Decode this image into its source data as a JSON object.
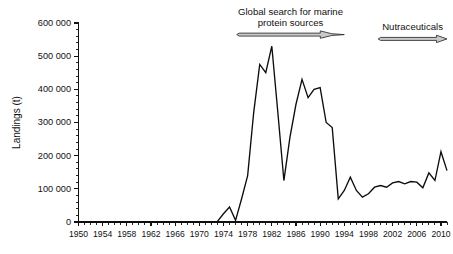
{
  "chart_data": {
    "type": "line",
    "title": "",
    "xlabel": "",
    "ylabel": "Landings (t)",
    "xlim": [
      1950,
      2011
    ],
    "ylim": [
      0,
      600000
    ],
    "grid": false,
    "legend": null,
    "y_ticks": [
      0,
      100000,
      200000,
      300000,
      400000,
      500000,
      600000
    ],
    "y_tick_labels": [
      "0",
      "100 000",
      "200 000",
      "300 000",
      "400 000",
      "500 000",
      "600 000"
    ],
    "y_minor_tick_interval": 20000,
    "x_ticks": [
      1950,
      1954,
      1958,
      1962,
      1966,
      1970,
      1974,
      1978,
      1982,
      1986,
      1990,
      1994,
      1998,
      2002,
      2006,
      2010
    ],
    "x_tick_labels": [
      "1950",
      "1954",
      "1958",
      "1962",
      "1966",
      "1970",
      "1974",
      "1978",
      "1982",
      "1986",
      "1990",
      "1994",
      "1998",
      "2002",
      "2006",
      "2010"
    ],
    "x_minor_tick_interval": 1,
    "series": [
      {
        "name": "Landings",
        "color": "#0d0d0d",
        "x": [
          1950,
          1951,
          1952,
          1953,
          1954,
          1955,
          1956,
          1957,
          1958,
          1959,
          1960,
          1961,
          1962,
          1963,
          1964,
          1965,
          1966,
          1967,
          1968,
          1969,
          1970,
          1971,
          1972,
          1973,
          1974,
          1975,
          1976,
          1977,
          1978,
          1979,
          1980,
          1981,
          1982,
          1983,
          1984,
          1985,
          1986,
          1987,
          1988,
          1989,
          1990,
          1991,
          1992,
          1993,
          1994,
          1995,
          1996,
          1997,
          1998,
          1999,
          2000,
          2001,
          2002,
          2003,
          2004,
          2005,
          2006,
          2007,
          2008,
          2009,
          2010,
          2011
        ],
        "values": [
          0,
          0,
          0,
          0,
          0,
          0,
          0,
          0,
          0,
          0,
          0,
          0,
          0,
          0,
          0,
          0,
          0,
          0,
          0,
          0,
          0,
          0,
          0,
          2000,
          25000,
          45000,
          5000,
          70000,
          140000,
          330000,
          475000,
          450000,
          530000,
          330000,
          125000,
          255000,
          355000,
          430000,
          375000,
          400000,
          405000,
          300000,
          285000,
          70000,
          95000,
          135000,
          95000,
          75000,
          85000,
          105000,
          110000,
          105000,
          118000,
          122000,
          115000,
          122000,
          120000,
          103000,
          148000,
          125000,
          212000,
          155000
        ]
      }
    ],
    "annotations": [
      {
        "id": "global-search",
        "text_lines": [
          "Global search for marine",
          "protein sources"
        ],
        "arrow": {
          "x_start": 1976.2,
          "x_end": 1994.0,
          "style": "block-arrow-tapered",
          "y_value": 565000
        }
      },
      {
        "id": "nutraceuticals",
        "text_lines": [
          "Nutraceuticals"
        ],
        "arrow": {
          "x_start": 1999.6,
          "x_end": 2011.0,
          "style": "block-arrow",
          "y_value": 552000
        }
      }
    ]
  }
}
